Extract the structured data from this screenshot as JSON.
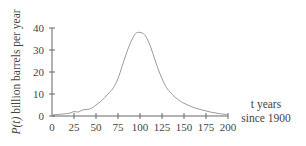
{
  "chart_data": {
    "type": "line",
    "title": "",
    "xlabel": "t years since 1900",
    "xlabel_lines": [
      "t years",
      "since 1900"
    ],
    "ylabel": "P(t) billion barrels per year",
    "xlim": [
      0,
      200
    ],
    "ylim": [
      0,
      40
    ],
    "x_ticks": [
      0,
      25,
      50,
      75,
      100,
      125,
      150,
      175,
      200
    ],
    "y_ticks": [
      0,
      10,
      20,
      30,
      40
    ],
    "grid": false,
    "legend": null,
    "series": [
      {
        "name": "P(t)",
        "color": "#9a9a9a",
        "x": [
          0,
          10,
          20,
          25,
          30,
          35,
          40,
          45,
          50,
          55,
          60,
          65,
          70,
          75,
          80,
          85,
          90,
          95,
          100,
          105,
          110,
          115,
          120,
          125,
          130,
          135,
          140,
          145,
          150,
          160,
          170,
          180,
          190,
          200
        ],
        "y": [
          0.5,
          0.8,
          1.3,
          2.0,
          1.8,
          2.8,
          3.0,
          3.5,
          5.0,
          6.5,
          8.5,
          10.5,
          13,
          17,
          23,
          29,
          34,
          37.5,
          38,
          37,
          33.5,
          28,
          22,
          17,
          13,
          10.5,
          8.5,
          7,
          5.8,
          4,
          2.8,
          1.8,
          1.1,
          0.6
        ]
      }
    ]
  }
}
